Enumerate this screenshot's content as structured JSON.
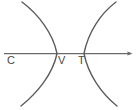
{
  "figure": {
    "kind": "geometry-diagram",
    "canvas": {
      "width": 137,
      "height": 110,
      "background": "#ffffff"
    },
    "stroke_color": "#5a5a5a",
    "axis_color": "#6a6a6a",
    "label_color": "#4a4a4a"
  },
  "axis": {
    "name": "horizontal-axis",
    "y": 53.5,
    "x_start": 4,
    "x_end": 132,
    "arrow_at": "right"
  },
  "curves": [
    {
      "name": "left-curve",
      "opens": "left",
      "vertex": {
        "x": 57,
        "y": 53.5
      },
      "top_end": {
        "x": 22,
        "y": 2
      },
      "bottom_end": {
        "x": 21,
        "y": 106
      }
    },
    {
      "name": "right-curve",
      "opens": "right",
      "vertex": {
        "x": 84,
        "y": 53.5
      },
      "top_end": {
        "x": 116,
        "y": 2
      },
      "bottom_end": {
        "x": 117,
        "y": 106
      }
    }
  ],
  "labels": {
    "c": "C",
    "v": "V",
    "t": "T"
  }
}
